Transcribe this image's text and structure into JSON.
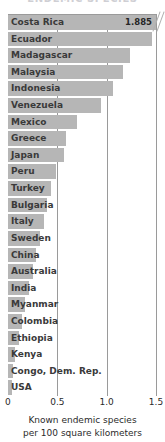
{
  "chart_data": {
    "type": "bar",
    "orientation": "horizontal",
    "title": "ENDEMIC SPECIES",
    "xlabel_line1": "Known endemic species",
    "xlabel_line2": "per 100 square kilometers",
    "ylabel": "",
    "grid": true,
    "legend": "none",
    "xlim": [
      0,
      1.5
    ],
    "xticks": [
      0,
      0.5,
      1.0,
      1.5
    ],
    "xtick_labels": [
      "0",
      "0.5",
      "1.0",
      "1.5"
    ],
    "axis_break_note": "Costa Rica bar is truncated at the axis maximum and annotated with its value",
    "categories": [
      "Costa Rica",
      "Ecuador",
      "Madagascar",
      "Malaysia",
      "Indonesia",
      "Venezuela",
      "Mexico",
      "Greece",
      "Japan",
      "Peru",
      "Turkey",
      "Bulgaria",
      "Italy",
      "Sweden",
      "China",
      "Australia",
      "India",
      "Myanmar",
      "Colombia",
      "Ethiopia",
      "Kenya",
      "Congo, Dem. Rep.",
      "USA"
    ],
    "values": [
      1.885,
      1.46,
      1.24,
      1.17,
      1.06,
      0.94,
      0.7,
      0.59,
      0.57,
      0.49,
      0.44,
      0.4,
      0.36,
      0.32,
      0.28,
      0.25,
      0.21,
      0.17,
      0.14,
      0.11,
      0.07,
      0.05,
      0.04
    ],
    "data_labels": [
      "1.885",
      "",
      "",
      "",
      "",
      "",
      "",
      "",
      "",
      "",
      "",
      "",
      "",
      "",
      "",
      "",
      "",
      "",
      "",
      "",
      "",
      "",
      ""
    ],
    "colors": {
      "bar": "#b6b6b6",
      "grid": "#9a9a9a",
      "label_text": "#3a3a3a",
      "axis_text": "#2b2b2b",
      "background": "#ffffff",
      "title": "#cfcfd4"
    }
  }
}
